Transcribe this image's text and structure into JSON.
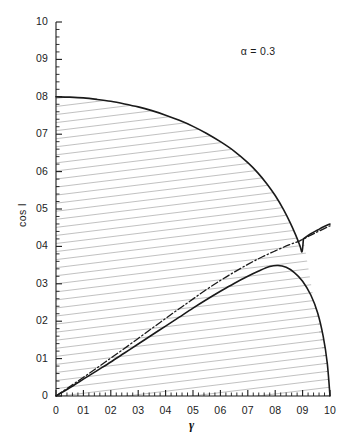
{
  "chart_data": {
    "type": "line",
    "title": "",
    "xlabel": "γ",
    "ylabel": "cos I",
    "xlim": [
      0,
      1
    ],
    "ylim": [
      0,
      1
    ],
    "grid": false,
    "legend": "none",
    "annotations": [
      {
        "name": "alpha-value",
        "text": "α = 0.3",
        "x": 0.74,
        "y": 0.92
      }
    ],
    "xticks": [
      0,
      0.1,
      0.2,
      0.3,
      0.4,
      0.5,
      0.6,
      0.7,
      0.8,
      0.9,
      1.0
    ],
    "xticklabels": [
      "0",
      "01",
      "02",
      "03",
      "04",
      "05",
      "06",
      "07",
      "08",
      "09",
      "10"
    ],
    "yticks": [
      0,
      0.1,
      0.2,
      0.3,
      0.4,
      0.5,
      0.6,
      0.7,
      0.8,
      0.9,
      1.0
    ],
    "yticklabels": [
      "0",
      "01",
      "02",
      "03",
      "04",
      "05",
      "06",
      "07",
      "08",
      "09",
      "10"
    ],
    "minor_ticks_per_interval": 5,
    "shaded_region_style": "diagonal-hatch",
    "series": [
      {
        "name": "upper-boundary-curve",
        "style": "solid",
        "color": "#1a1a1a",
        "points": [
          [
            0.0,
            0.8
          ],
          [
            0.05,
            0.799
          ],
          [
            0.1,
            0.797
          ],
          [
            0.15,
            0.793
          ],
          [
            0.2,
            0.788
          ],
          [
            0.25,
            0.781
          ],
          [
            0.3,
            0.773
          ],
          [
            0.35,
            0.763
          ],
          [
            0.4,
            0.751
          ],
          [
            0.45,
            0.737
          ],
          [
            0.5,
            0.721
          ],
          [
            0.55,
            0.702
          ],
          [
            0.6,
            0.68
          ],
          [
            0.65,
            0.655
          ],
          [
            0.7,
            0.624
          ],
          [
            0.735,
            0.598
          ],
          [
            0.77,
            0.567
          ],
          [
            0.8,
            0.536
          ],
          [
            0.83,
            0.499
          ],
          [
            0.855,
            0.463
          ],
          [
            0.875,
            0.43
          ],
          [
            0.89,
            0.402
          ],
          [
            0.898,
            0.386
          ],
          [
            0.903,
            0.42
          ]
        ]
      },
      {
        "name": "upper-branch-rising",
        "style": "solid",
        "color": "#1a1a1a",
        "points": [
          [
            0.903,
            0.42
          ],
          [
            0.93,
            0.434
          ],
          [
            0.955,
            0.444
          ],
          [
            0.975,
            0.452
          ],
          [
            1.0,
            0.46
          ]
        ]
      },
      {
        "name": "lower-boundary-curve",
        "style": "solid",
        "color": "#1a1a1a",
        "points": [
          [
            0.0,
            0.0
          ],
          [
            0.05,
            0.022
          ],
          [
            0.1,
            0.045
          ],
          [
            0.15,
            0.068
          ],
          [
            0.2,
            0.091
          ],
          [
            0.25,
            0.115
          ],
          [
            0.3,
            0.139
          ],
          [
            0.35,
            0.163
          ],
          [
            0.4,
            0.187
          ],
          [
            0.45,
            0.211
          ],
          [
            0.5,
            0.235
          ],
          [
            0.55,
            0.258
          ],
          [
            0.6,
            0.28
          ],
          [
            0.65,
            0.301
          ],
          [
            0.7,
            0.32
          ],
          [
            0.74,
            0.334
          ],
          [
            0.78,
            0.346
          ],
          [
            0.81,
            0.349
          ],
          [
            0.84,
            0.344
          ],
          [
            0.87,
            0.33
          ],
          [
            0.9,
            0.307
          ],
          [
            0.93,
            0.27
          ],
          [
            0.955,
            0.222
          ],
          [
            0.975,
            0.16
          ],
          [
            0.99,
            0.088
          ],
          [
            1.0,
            0.0
          ]
        ]
      },
      {
        "name": "dash-dot-asymptote",
        "style": "dash-dot",
        "color": "#1a1a1a",
        "points": [
          [
            0.0,
            0.0
          ],
          [
            0.06,
            0.03
          ],
          [
            0.12,
            0.06
          ],
          [
            0.18,
            0.091
          ],
          [
            0.24,
            0.122
          ],
          [
            0.3,
            0.154
          ],
          [
            0.36,
            0.186
          ],
          [
            0.42,
            0.218
          ],
          [
            0.48,
            0.249
          ],
          [
            0.54,
            0.28
          ],
          [
            0.6,
            0.309
          ],
          [
            0.65,
            0.331
          ],
          [
            0.7,
            0.352
          ],
          [
            0.75,
            0.371
          ],
          [
            0.8,
            0.388
          ],
          [
            0.85,
            0.404
          ],
          [
            0.89,
            0.415
          ],
          [
            0.93,
            0.43
          ],
          [
            0.96,
            0.441
          ],
          [
            1.0,
            0.455
          ]
        ]
      }
    ]
  },
  "axis": {
    "ylabel_full": "cos I",
    "xlabel_full": "γ"
  }
}
